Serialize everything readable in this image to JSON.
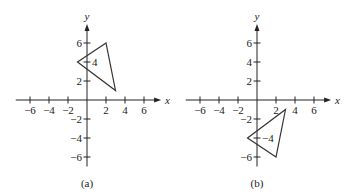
{
  "panels": [
    {
      "id": "a",
      "caption": "(a)",
      "x_label": "x",
      "y_label": "y",
      "x_ticks": [
        -6,
        -4,
        -2,
        2,
        4,
        6
      ],
      "y_ticks": [
        6,
        4,
        2,
        -2,
        -4,
        -6
      ],
      "x_tick_labels": [
        "−6",
        "−4",
        "−2",
        "2",
        "4",
        "6"
      ],
      "y_tick_labels": [
        "6",
        "4",
        "2",
        "−2",
        "−4",
        "−6"
      ],
      "triangle": [
        [
          -1,
          4
        ],
        [
          2,
          6
        ],
        [
          3,
          1
        ]
      ]
    },
    {
      "id": "b",
      "caption": "(b)",
      "x_label": "x",
      "y_label": "y",
      "x_ticks": [
        -6,
        -4,
        -2,
        2,
        4,
        6
      ],
      "y_ticks": [
        6,
        4,
        2,
        -2,
        -4,
        -6
      ],
      "x_tick_labels": [
        "−6",
        "−4",
        "−2",
        "2",
        "4",
        "6"
      ],
      "y_tick_labels": [
        "6",
        "4",
        "2",
        "−2",
        "−4",
        "−6"
      ],
      "triangle": [
        [
          -1,
          -4
        ],
        [
          2,
          -6
        ],
        [
          3,
          -1
        ]
      ]
    }
  ]
}
